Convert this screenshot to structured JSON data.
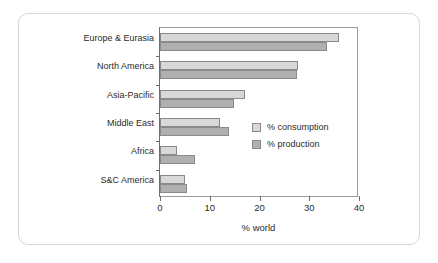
{
  "chart_data": {
    "type": "bar",
    "orientation": "horizontal",
    "title": "",
    "xlabel": "% world",
    "ylabel": "",
    "xlim": [
      0,
      40
    ],
    "xticks": [
      0,
      10,
      20,
      30,
      40
    ],
    "grid": false,
    "legend_position": "inside-right",
    "categories": [
      "Europe & Eurasia",
      "North America",
      "Asia-Pacific",
      "Middle East",
      "Africa",
      "S&C America"
    ],
    "series": [
      {
        "name": "% consumption",
        "color": "#d8d8d8",
        "values": [
          36.0,
          27.8,
          17.0,
          12.0,
          3.4,
          5.0
        ]
      },
      {
        "name": "% production",
        "color": "#b0b0b0",
        "values": [
          33.5,
          27.5,
          14.8,
          13.8,
          7.0,
          5.5
        ]
      }
    ]
  }
}
